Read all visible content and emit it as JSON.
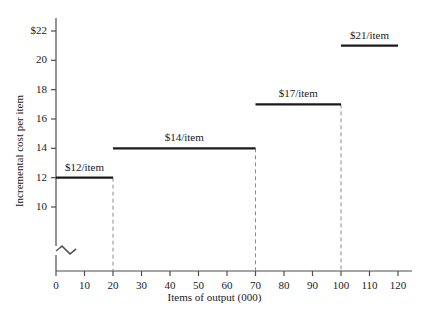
{
  "chart_data": {
    "type": "bar",
    "title": "",
    "xlabel": "Items of output (000)",
    "ylabel": "Incremental cost per item",
    "xlim": [
      0,
      120
    ],
    "ylim": [
      9.2,
      22.6
    ],
    "y_axis_break": true,
    "y_break_note": "axis broken between 0 and 10",
    "grid": false,
    "legend": null,
    "xticks": [
      0,
      10,
      20,
      30,
      40,
      50,
      60,
      70,
      80,
      90,
      100,
      110,
      120
    ],
    "xticklabels": [
      "0",
      "10",
      "20",
      "30",
      "40",
      "50",
      "60",
      "70",
      "80",
      "90",
      "100",
      "110",
      "120"
    ],
    "yticks": [
      10,
      12,
      14,
      16,
      18,
      20,
      22
    ],
    "yticklabels": [
      "10",
      "12",
      "14",
      "16",
      "18",
      "20",
      "$22"
    ],
    "steps": [
      {
        "label": "$12/item",
        "value": 12,
        "x_start": 0,
        "x_end": 20,
        "label_x": 10,
        "divider_after": true
      },
      {
        "label": "$14/item",
        "value": 14,
        "x_start": 20,
        "x_end": 70,
        "label_x": 45,
        "divider_after": true
      },
      {
        "label": "$17/item",
        "value": 17,
        "x_start": 70,
        "x_end": 100,
        "label_x": 85,
        "divider_after": true
      },
      {
        "label": "$21/item",
        "value": 21,
        "x_start": 100,
        "x_end": 120,
        "label_x": 110,
        "divider_after": false
      }
    ],
    "dashed_dividers": [
      20,
      70,
      100
    ],
    "colors": {
      "background": "#ffffff",
      "axis": "#4d4d4d",
      "step_line": "#1a1a1a",
      "divider": "#8c8c8c",
      "text": "#1a1a1a"
    }
  }
}
